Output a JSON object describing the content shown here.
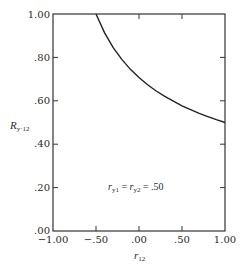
{
  "chart_data": {
    "type": "line",
    "title": "",
    "xlabel": "r12",
    "ylabel": "R y·12",
    "xlim": [
      -1.0,
      1.0
    ],
    "ylim": [
      0.0,
      1.0
    ],
    "grid": false,
    "x_ticks": [
      "-1.00",
      "-.50",
      ".00",
      ".50",
      "1.00"
    ],
    "y_ticks": [
      ".00",
      ".20",
      ".40",
      ".60",
      ".80",
      "1.00"
    ],
    "annotation": "r y1 = r y2 = .50",
    "series": [
      {
        "name": "R y·12",
        "x": [
          -0.5,
          -0.4,
          -0.3,
          -0.2,
          -0.1,
          0.0,
          0.1,
          0.2,
          0.3,
          0.4,
          0.5,
          0.6,
          0.7,
          0.8,
          0.9,
          1.0
        ],
        "values": [
          1.0,
          0.913,
          0.845,
          0.791,
          0.745,
          0.707,
          0.674,
          0.645,
          0.62,
          0.598,
          0.577,
          0.559,
          0.542,
          0.527,
          0.513,
          0.5
        ]
      }
    ]
  },
  "labels": {
    "x_ticks": [
      "−1.00",
      "−.50",
      ".00",
      ".50",
      "1.00"
    ],
    "y_ticks": [
      ".00",
      ".20",
      ".40",
      ".60",
      ".80",
      "1.00"
    ],
    "xlabel_main": "r",
    "xlabel_sub": "12",
    "ylabel_main": "R",
    "ylabel_sub": "y·12",
    "annot_r1": "r",
    "annot_sub1": "y1",
    "annot_eq1": " = ",
    "annot_r2": "r",
    "annot_sub2": "y2",
    "annot_eq2": " = .50"
  }
}
